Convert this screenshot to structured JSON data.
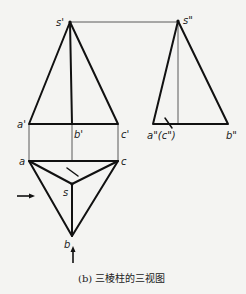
{
  "diagram": {
    "caption": "(b) 三棱柱的三视图",
    "front_view": {
      "labels": {
        "s": "s'",
        "a": "a'",
        "b": "b'",
        "c": "c'"
      }
    },
    "side_view": {
      "labels": {
        "s": "s\"",
        "ac": "a\"(c\")",
        "b": "b\""
      }
    },
    "top_view": {
      "labels": {
        "a": "a",
        "b": "b",
        "c": "c",
        "s": "s"
      }
    },
    "colors": {
      "line": "#111111",
      "background": "#f4f4f2"
    }
  }
}
